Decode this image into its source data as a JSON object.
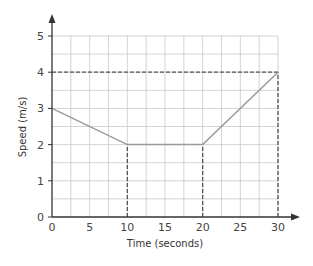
{
  "chart_data": {
    "type": "line",
    "title": "",
    "xlabel": "Time (seconds)",
    "ylabel": "Speed (m/s)",
    "xlim": [
      0,
      30
    ],
    "ylim": [
      0,
      5
    ],
    "x_ticks": [
      0,
      5,
      10,
      15,
      20,
      25,
      30
    ],
    "y_ticks": [
      0,
      1,
      2,
      3,
      4,
      5
    ],
    "grid": true,
    "minor_grid": {
      "x_step": 2.5,
      "y_step": 0.5
    },
    "legend": null,
    "series": [
      {
        "name": "speed",
        "x": [
          0,
          10,
          20,
          30
        ],
        "y": [
          3,
          2,
          2,
          4
        ],
        "color": "#9a9a9a"
      }
    ],
    "reference_lines": [
      {
        "type": "horizontal",
        "y": 4,
        "from_x": 0,
        "to_x": 30,
        "style": "dashed"
      },
      {
        "type": "vertical",
        "x": 10,
        "from_y": 0,
        "to_y": 2,
        "style": "dashed"
      },
      {
        "type": "vertical",
        "x": 20,
        "from_y": 0,
        "to_y": 2,
        "style": "dashed"
      },
      {
        "type": "vertical",
        "x": 30,
        "from_y": 0,
        "to_y": 4,
        "style": "dashed"
      }
    ]
  },
  "colors": {
    "axis": "#333333",
    "grid": "#c8c8c8",
    "line": "#9a9a9a",
    "dashed": "#555555",
    "text": "#444444"
  }
}
